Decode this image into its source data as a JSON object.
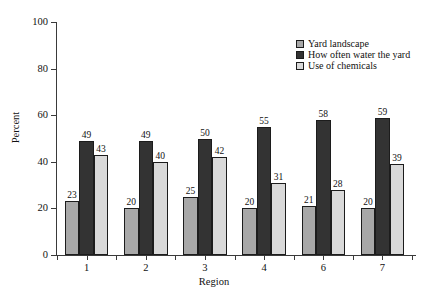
{
  "chart_data": {
    "type": "bar",
    "title": "",
    "xlabel": "Region",
    "ylabel": "Percent",
    "ylim": [
      0,
      100
    ],
    "yticks": [
      0,
      20,
      40,
      60,
      80,
      100
    ],
    "grid": false,
    "legend_position": "top-right",
    "categories": [
      "1",
      "2",
      "3",
      "4",
      "6",
      "7"
    ],
    "series": [
      {
        "name": "Yard landscape",
        "color": "#a8a8a8",
        "values": [
          23,
          20,
          25,
          20,
          21,
          20
        ]
      },
      {
        "name": "How often water the yard",
        "color": "#333333",
        "values": [
          49,
          49,
          50,
          55,
          58,
          59
        ]
      },
      {
        "name": "Use of chemicals",
        "color": "#d9d9d9",
        "values": [
          43,
          40,
          42,
          31,
          28,
          39
        ]
      }
    ]
  },
  "legend": {
    "items": [
      {
        "label": "Yard landscape",
        "color": "#a8a8a8"
      },
      {
        "label": "How often water the yard",
        "color": "#333333"
      },
      {
        "label": "Use of chemicals",
        "color": "#d9d9d9"
      }
    ]
  },
  "axes": {
    "y_title": "Percent",
    "x_title": "Region",
    "y_tick_labels": [
      "0",
      "20",
      "40",
      "60",
      "80",
      "100"
    ],
    "x_tick_labels": [
      "1",
      "2",
      "3",
      "4",
      "6",
      "7"
    ]
  }
}
